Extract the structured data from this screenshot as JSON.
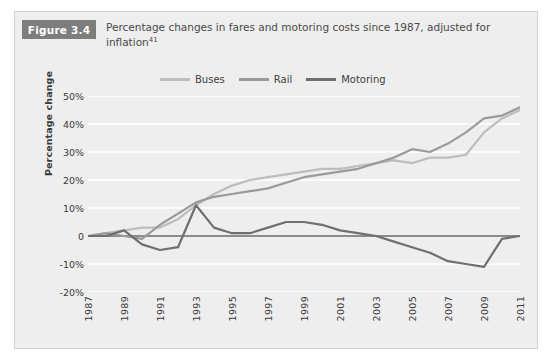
{
  "figure": {
    "badge_label": "Figure 3.4",
    "title_line1": "Percentage changes in fares and motoring costs since 1987, adjusted",
    "title_line2": "for inflation",
    "title_footnote": "41"
  },
  "colors": {
    "panel_background": "#eeeeee",
    "panel_border": "#d2d2d2",
    "badge_background": "#7d7d7d",
    "gridline": "#fbfbfb",
    "zero_line": "#1c1c1c",
    "buses": "#bdbdbd",
    "rail": "#9a9a9a",
    "motoring": "#6f6f6f",
    "text": "#3a3a3a"
  },
  "legend": {
    "items": [
      {
        "label": "Buses",
        "color": "#bdbdbd",
        "swatch_name": "legend-swatch-buses"
      },
      {
        "label": "Rail",
        "color": "#9a9a9a",
        "swatch_name": "legend-swatch-rail"
      },
      {
        "label": "Motoring",
        "color": "#6f6f6f",
        "swatch_name": "legend-swatch-motoring"
      }
    ]
  },
  "chart_data": {
    "type": "line",
    "title": "Percentage changes in fares and motoring costs since 1987, adjusted for inflation",
    "xlabel": "",
    "ylabel": "Percentage change",
    "xlim": [
      1987,
      2011
    ],
    "ylim": [
      -20,
      50
    ],
    "grid": true,
    "legend_position": "top-center",
    "ytick_labels": [
      "50%",
      "40%",
      "30%",
      "20%",
      "10%",
      "0",
      "-10%",
      "-20%"
    ],
    "ytick_values": [
      50,
      40,
      30,
      20,
      10,
      0,
      -10,
      -20
    ],
    "xtick_labels": [
      "1987",
      "1989",
      "1991",
      "1993",
      "1995",
      "1997",
      "1999",
      "2001",
      "2003",
      "2005",
      "2007",
      "2009",
      "2011"
    ],
    "xtick_values": [
      1987,
      1989,
      1991,
      1993,
      1995,
      1997,
      1999,
      2001,
      2003,
      2005,
      2007,
      2009,
      2011
    ],
    "x": [
      1987,
      1988,
      1989,
      1990,
      1991,
      1992,
      1993,
      1994,
      1995,
      1996,
      1997,
      1998,
      1999,
      2000,
      2001,
      2002,
      2003,
      2004,
      2005,
      2006,
      2007,
      2008,
      2009,
      2010,
      2011
    ],
    "series": [
      {
        "name": "Buses",
        "color": "#bdbdbd",
        "values": [
          0,
          1,
          2,
          3,
          3,
          6,
          11,
          15,
          18,
          20,
          21,
          22,
          23,
          24,
          24,
          25,
          26,
          27,
          26,
          28,
          28,
          29,
          37,
          42,
          45
        ]
      },
      {
        "name": "Rail",
        "color": "#9a9a9a",
        "values": [
          0,
          1,
          0,
          -1,
          4,
          8,
          12,
          14,
          15,
          16,
          17,
          19,
          21,
          22,
          23,
          24,
          26,
          28,
          31,
          30,
          33,
          37,
          42,
          43,
          46
        ]
      },
      {
        "name": "Motoring",
        "color": "#6f6f6f",
        "values": [
          0,
          0,
          2,
          -3,
          -5,
          -4,
          11,
          3,
          1,
          1,
          3,
          5,
          5,
          4,
          2,
          1,
          0,
          -2,
          -4,
          -6,
          -9,
          -10,
          -11,
          -1,
          0
        ]
      }
    ]
  }
}
